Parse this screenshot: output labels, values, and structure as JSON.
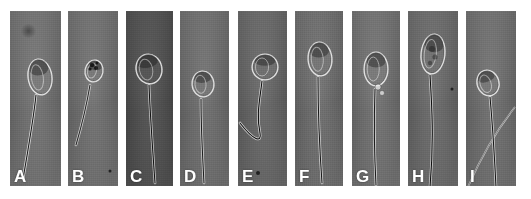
{
  "figure": {
    "caption": "",
    "background_color": "#ffffff",
    "width": 531,
    "height": 199,
    "panel_count": 9,
    "image_type": "phase-contrast light micrograph plate"
  },
  "panels": [
    {
      "id": "panel-a",
      "label": "A",
      "x": 10,
      "y": 11,
      "w": 51,
      "h": 175,
      "bg_color": "#7b7b7b",
      "bg_color_dark": "#6a6a6a",
      "head_shape": "normal oval head, tapering",
      "description": "Normal spermatozoon with smooth oval head and straight tail",
      "head": {
        "cx": 30,
        "cy": 66,
        "rx": 11,
        "ry": 17,
        "rot": -8
      },
      "tail": "M 26 84 C 24 104, 20 128, 13 168",
      "tail_color": "#e8e8e8",
      "tail_core": "#1c1c1c",
      "artifacts": [
        {
          "type": "smudge",
          "x": 10,
          "y": 13,
          "w": 17,
          "h": 14
        }
      ]
    },
    {
      "id": "panel-b",
      "label": "B",
      "x": 68,
      "y": 11,
      "w": 50,
      "h": 175,
      "bg_color": "#797979",
      "bg_color_dark": "#686868",
      "head_shape": "amorphous / irregular head with vacuoles",
      "description": "Abnormal spermatozoon with small amorphous head and dark vacuoles",
      "head": {
        "cx": 26,
        "cy": 60,
        "rx": 8,
        "ry": 10,
        "rot": 10
      },
      "tail": "M 22 74 C 19 92, 15 110, 8 134",
      "tail_color": "#d8d8d8",
      "tail_core": "#2a2a2a",
      "artifacts": [
        {
          "type": "speck",
          "x": 42,
          "y": 160,
          "w": 3,
          "h": 3
        }
      ]
    },
    {
      "id": "panel-c",
      "label": "C",
      "x": 126,
      "y": 11,
      "w": 47,
      "h": 175,
      "bg_color": "#565656",
      "bg_color_dark": "#484848",
      "head_shape": "large irregular pyriform head",
      "description": "Spermatozoon with enlarged irregular head and long tail",
      "head": {
        "cx": 23,
        "cy": 58,
        "rx": 12,
        "ry": 14,
        "rot": -12
      },
      "tail": "M 23 74 C 24 100, 26 130, 29 172",
      "tail_color": "#d9d9d9",
      "tail_core": "#141414",
      "artifacts": []
    },
    {
      "id": "panel-d",
      "label": "D",
      "x": 180,
      "y": 11,
      "w": 49,
      "h": 175,
      "bg_color": "#777777",
      "bg_color_dark": "#666666",
      "head_shape": "small round / short oval head",
      "description": "Spermatozoon with small rounded head and long straight tail",
      "head": {
        "cx": 23,
        "cy": 73,
        "rx": 10,
        "ry": 12,
        "rot": -5
      },
      "tail": "M 21 88 C 21 110, 22 136, 24 172",
      "tail_color": "#e2e2e2",
      "tail_core": "#1e1e1e",
      "artifacts": []
    },
    {
      "id": "panel-e",
      "label": "E",
      "x": 238,
      "y": 11,
      "w": 49,
      "h": 175,
      "bg_color": "#6f6f6f",
      "bg_color_dark": "#5e5e5e",
      "head_shape": "round head with halo",
      "description": "Round-headed spermatozoon with sharply bent, coiled tail",
      "head": {
        "cx": 27,
        "cy": 56,
        "rx": 12,
        "ry": 12,
        "rot": 0
      },
      "tail": "M 24 70 C 22 88, 18 104, 22 122 C 24 132, 16 130, 2 112",
      "tail_color": "#e0e0e0",
      "tail_core": "#121212",
      "artifacts": [
        {
          "type": "speck",
          "x": 20,
          "y": 162,
          "w": 4,
          "h": 4
        }
      ]
    },
    {
      "id": "panel-f",
      "label": "F",
      "x": 295,
      "y": 11,
      "w": 48,
      "h": 175,
      "bg_color": "#767676",
      "bg_color_dark": "#656565",
      "head_shape": "normal oval head",
      "description": "Normal spermatozoon, oval head with well defined acrosome and straight tail",
      "head": {
        "cx": 25,
        "cy": 48,
        "rx": 11,
        "ry": 16,
        "rot": -4
      },
      "tail": "M 23 66 C 23 96, 24 130, 27 172",
      "tail_color": "#e6e6e6",
      "tail_core": "#1a1a1a",
      "artifacts": []
    },
    {
      "id": "panel-g",
      "label": "G",
      "x": 352,
      "y": 11,
      "w": 48,
      "h": 175,
      "bg_color": "#7a7a7a",
      "bg_color_dark": "#696969",
      "head_shape": "pyriform (pear-shaped) head",
      "description": "Spermatozoon with pear-shaped head and cytoplasmic droplets at the neck",
      "head": {
        "cx": 24,
        "cy": 58,
        "rx": 11,
        "ry": 16,
        "rot": 0
      },
      "tail": "M 23 78 C 22 106, 22 138, 24 174",
      "tail_color": "#e4e4e4",
      "tail_core": "#1b1b1b",
      "artifacts": [
        {
          "type": "droplet",
          "x": 26,
          "y": 76,
          "w": 6,
          "h": 6
        },
        {
          "type": "droplet",
          "x": 30,
          "y": 82,
          "w": 5,
          "h": 5
        }
      ]
    },
    {
      "id": "panel-h",
      "label": "H",
      "x": 408,
      "y": 11,
      "w": 50,
      "h": 175,
      "bg_color": "#737373",
      "bg_color_dark": "#626262",
      "head_shape": "elongated / macrocephalic head with vacuoles",
      "description": "Spermatozoon with large elongated vacuolated head and long diagonal tail",
      "head": {
        "cx": 25,
        "cy": 43,
        "rx": 11,
        "ry": 19,
        "rot": 6
      },
      "tail": "M 22 64 C 24 96, 26 130, 22 176",
      "tail_color": "#dcdcdc",
      "tail_core": "#101010",
      "artifacts": [
        {
          "type": "speck",
          "x": 44,
          "y": 78,
          "w": 3,
          "h": 3
        }
      ]
    },
    {
      "id": "panel-i",
      "label": "I",
      "x": 466,
      "y": 11,
      "w": 50,
      "h": 175,
      "bg_color": "#787878",
      "bg_color_dark": "#676767",
      "head_shape": "small tapered head",
      "description": "Spermatozoon with small head and two crossing tails in the field",
      "head": {
        "cx": 22,
        "cy": 72,
        "rx": 10,
        "ry": 12,
        "rot": -18
      },
      "tail": "M 24 86 C 26 108, 28 136, 30 176",
      "tail_color": "#e0e0e0",
      "tail_core": "#181818",
      "artifacts": [
        {
          "type": "extra-tail",
          "path": "M 2 176 C 14 148, 30 120, 49 96"
        }
      ]
    }
  ]
}
